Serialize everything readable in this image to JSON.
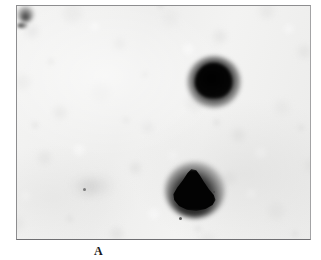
{
  "figure": {
    "panel_label": "A",
    "kind": "autoradiograph-plate",
    "background_color": "#f1f1f0",
    "border_color": "#8d8d8f",
    "spot_color": "#0b0b0b",
    "caption_color": "#1a1a1a"
  },
  "plate": {
    "frame": {
      "x": 16,
      "y": 5,
      "width": 295,
      "height": 235
    },
    "spots": [
      {
        "name": "upper-spot",
        "shape": "round-dome",
        "center_x": 196,
        "center_y": 75,
        "width": 37,
        "height": 35,
        "intensity": "dark"
      },
      {
        "name": "lower-spot",
        "shape": "triangular-teardrop",
        "center_x": 177,
        "center_y": 184,
        "width": 44,
        "height": 42,
        "intensity": "dark"
      }
    ],
    "artifacts": [
      {
        "name": "speck-left",
        "x": 66,
        "y": 182,
        "size": 3
      },
      {
        "name": "speck-bottom",
        "x": 162,
        "y": 211,
        "size": 3
      },
      {
        "name": "speck-mid",
        "x": 196,
        "y": 185,
        "size": 2
      }
    ]
  }
}
